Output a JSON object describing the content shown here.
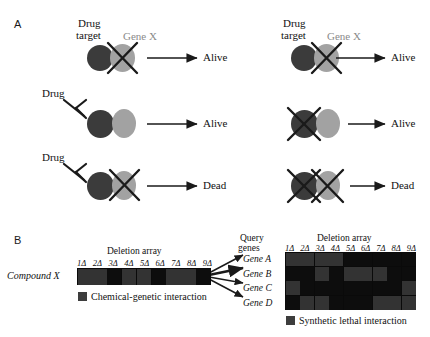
{
  "figure": {
    "panels": [
      {
        "letter": "A"
      },
      {
        "letter": "B"
      }
    ]
  },
  "panel_a": {
    "labels": {
      "drug_target": "Drug\ntarget",
      "drug_target_line1": "Drug",
      "drug_target_line2": "target",
      "gene_x": "Gene X",
      "drug": "Drug",
      "alive": "Alive",
      "dead": "Dead"
    },
    "colors": {
      "drug_target_node": "#3b3b3b",
      "gene_x_node": "#a2a2a2",
      "gene_x_label": "#8a8a8a",
      "stroke": "#1a1a1a"
    },
    "columns": [
      {
        "id": "left",
        "rows": [
          {
            "id": "left-row-1",
            "drug_present": false,
            "target_crossed": false,
            "gene_x_crossed": true,
            "outcome": "Alive"
          },
          {
            "id": "left-row-2",
            "drug_present": true,
            "target_crossed": false,
            "gene_x_crossed": false,
            "outcome": "Alive"
          },
          {
            "id": "left-row-3",
            "drug_present": true,
            "target_crossed": false,
            "gene_x_crossed": true,
            "outcome": "Dead"
          }
        ]
      },
      {
        "id": "right",
        "rows": [
          {
            "id": "right-row-1",
            "drug_present": false,
            "target_crossed": false,
            "gene_x_crossed": true,
            "outcome": "Alive"
          },
          {
            "id": "right-row-2",
            "drug_present": false,
            "target_crossed": true,
            "gene_x_crossed": false,
            "outcome": "Alive"
          },
          {
            "id": "right-row-3",
            "drug_present": false,
            "target_crossed": true,
            "gene_x_crossed": true,
            "outcome": "Dead"
          }
        ]
      }
    ]
  },
  "panel_b": {
    "left": {
      "array_title": "Deletion array",
      "row_label": "Compound X",
      "tick_labels": [
        "1Δ",
        "2Δ",
        "3Δ",
        "4Δ",
        "5Δ",
        "6Δ",
        "7Δ",
        "8Δ",
        "9Δ"
      ],
      "legend_label": "Chemical-genetic interaction",
      "legend_color": "#3d3d3d",
      "values": [
        1,
        1,
        0,
        1,
        1,
        0,
        1,
        1,
        0
      ]
    },
    "right": {
      "query_title_line1": "Query",
      "query_title_line2": "genes",
      "array_title": "Deletion array",
      "tick_labels": [
        "1Δ",
        "2Δ",
        "3Δ",
        "4Δ",
        "5Δ",
        "6Δ",
        "7Δ",
        "8Δ",
        "9Δ"
      ],
      "row_labels": [
        "Gene A",
        "Gene B",
        "Gene C",
        "Gene D"
      ],
      "legend_label": "Synthetic lethal interaction",
      "legend_color": "#3d3d3d",
      "matrix": [
        [
          1,
          1,
          1,
          1,
          0,
          0,
          0,
          0,
          0
        ],
        [
          0,
          0,
          1,
          0,
          1,
          1,
          1,
          0,
          0
        ],
        [
          1,
          0,
          0,
          0,
          0,
          0,
          0,
          0,
          1
        ],
        [
          0,
          1,
          1,
          0,
          0,
          0,
          1,
          1,
          1
        ]
      ]
    }
  },
  "chart_data": {
    "type": "heatmap",
    "panels": [
      {
        "name": "Compound X chemical-genetic profile",
        "xlabel": "Deletion array",
        "ylabel": "",
        "categories": [
          "1Δ",
          "2Δ",
          "3Δ",
          "4Δ",
          "5Δ",
          "6Δ",
          "7Δ",
          "8Δ",
          "9Δ"
        ],
        "rows": [
          "Compound X"
        ],
        "values": [
          [
            1,
            1,
            0,
            1,
            1,
            0,
            1,
            1,
            0
          ]
        ],
        "legend": "Chemical-genetic interaction"
      },
      {
        "name": "Query gene synthetic lethal profiles",
        "xlabel": "Deletion array",
        "ylabel": "Query genes",
        "categories": [
          "1Δ",
          "2Δ",
          "3Δ",
          "4Δ",
          "5Δ",
          "6Δ",
          "7Δ",
          "8Δ",
          "9Δ"
        ],
        "rows": [
          "Gene A",
          "Gene B",
          "Gene C",
          "Gene D"
        ],
        "values": [
          [
            1,
            1,
            1,
            1,
            0,
            0,
            0,
            0,
            0
          ],
          [
            0,
            0,
            1,
            0,
            1,
            1,
            1,
            0,
            0
          ],
          [
            1,
            0,
            0,
            0,
            0,
            0,
            0,
            0,
            1
          ],
          [
            0,
            1,
            1,
            0,
            0,
            0,
            1,
            1,
            1
          ]
        ],
        "legend": "Synthetic lethal interaction"
      }
    ]
  }
}
